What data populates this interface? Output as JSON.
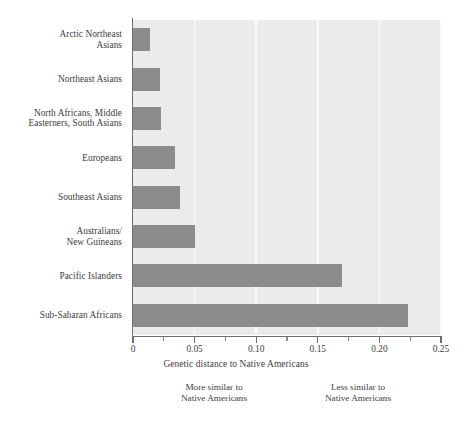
{
  "chart_data": {
    "type": "bar",
    "orientation": "horizontal",
    "title": "",
    "xlabel": "Genetic distance to Native Americans",
    "ylabel": "",
    "xlim": [
      0,
      0.25
    ],
    "grid": true,
    "legend": null,
    "categories": [
      "Arctic Northeast Asians",
      "Northeast Asians",
      "North Africans, Middle Easterners, South Asians",
      "Europeans",
      "Southeast Asians",
      "Australians/ New Guineans",
      "Pacific Islanders",
      "Sub-Saharan Africans"
    ],
    "values": [
      0.014,
      0.022,
      0.023,
      0.034,
      0.038,
      0.05,
      0.17,
      0.223
    ],
    "xticks": [
      0,
      0.05,
      0.1,
      0.15,
      0.2,
      0.25
    ],
    "xtick_labels": [
      "0",
      "0.05",
      "0.10",
      "0.15",
      "0.20",
      "0.25"
    ],
    "minor_xticks": [
      0.025,
      0.075,
      0.125,
      0.175,
      0.225
    ],
    "bar_color": "#8c8c8c",
    "plot_background": "#ebebeb",
    "gridline_color": "#fbfbfb",
    "annotations": {
      "left_text_line1": "More similar to",
      "left_text_line2": "Native Americans",
      "right_text_line1": "Less similar to",
      "right_text_line2": "Native Americans",
      "arrow": "double-headed-horizontal-arrow"
    }
  },
  "category_labels": [
    {
      "lines": [
        "Arctic Northeast",
        "Asians"
      ]
    },
    {
      "lines": [
        "Northeast Asians"
      ]
    },
    {
      "lines": [
        "North Africans, Middle",
        "Easterners, South Asians"
      ]
    },
    {
      "lines": [
        "Europeans"
      ]
    },
    {
      "lines": [
        "Southeast Asians"
      ]
    },
    {
      "lines": [
        "Australians/",
        "New Guineans"
      ]
    },
    {
      "lines": [
        "Pacific Islanders"
      ]
    },
    {
      "lines": [
        "Sub-Saharan Africans"
      ]
    }
  ]
}
